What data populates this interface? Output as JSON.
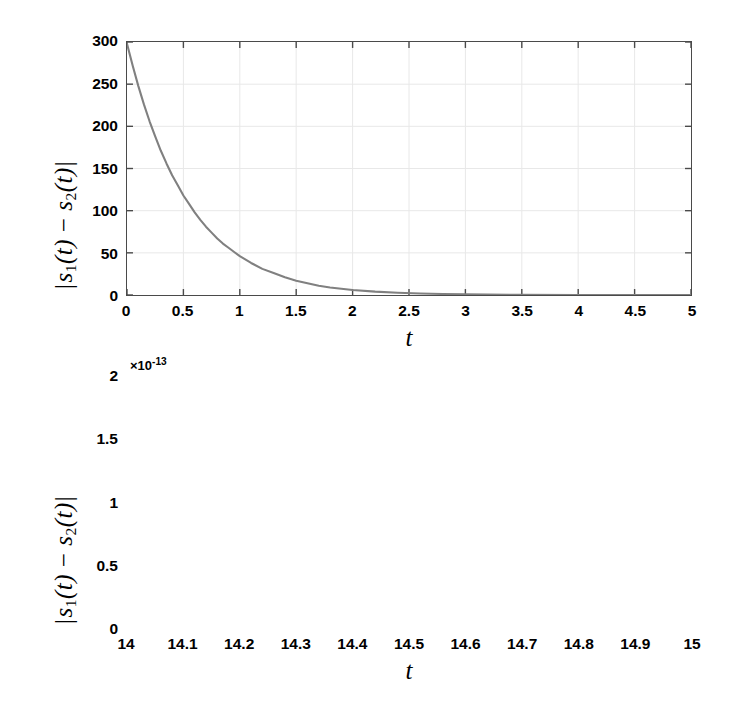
{
  "figure": {
    "background": "#ffffff",
    "curve_color": "#808080",
    "axis_color": "#4a4a4a",
    "grid_color": "#e8e8e8"
  },
  "chart_data": [
    {
      "type": "line",
      "panel": "top",
      "title": "",
      "xlabel": "t",
      "ylabel": "|s_1(t) - s_2(t)|",
      "ylabel_parts": {
        "open_bar": "|",
        "s": "s",
        "sub1": "1",
        "arg1": "(t)",
        "minus": "−",
        "sub2": "2",
        "arg2": "(t)",
        "close_bar": "|"
      },
      "xlim": [
        0,
        5
      ],
      "ylim": [
        0,
        300
      ],
      "grid": true,
      "legend": null,
      "xticks": [
        0,
        0.5,
        1,
        1.5,
        2,
        2.5,
        3,
        3.5,
        4,
        4.5,
        5
      ],
      "xticklabels": [
        "0",
        "0.5",
        "1",
        "1.5",
        "2",
        "2.5",
        "3",
        "3.5",
        "4",
        "4.5",
        "5"
      ],
      "yticks": [
        0,
        50,
        100,
        150,
        200,
        250,
        300
      ],
      "yticklabels": [
        "0",
        "50",
        "100",
        "150",
        "200",
        "250",
        "300"
      ],
      "y_exponent_label": "",
      "series": [
        {
          "name": "|s1(t)-s2(t)|",
          "x": [
            0,
            0.05,
            0.1,
            0.15,
            0.2,
            0.25,
            0.3,
            0.35,
            0.4,
            0.45,
            0.5,
            0.55,
            0.6,
            0.65,
            0.7,
            0.75,
            0.8,
            0.85,
            0.9,
            0.95,
            1.0,
            1.1,
            1.2,
            1.3,
            1.4,
            1.5,
            1.6,
            1.7,
            1.8,
            1.9,
            2.0,
            2.2,
            2.4,
            2.6,
            2.8,
            3.0,
            3.5,
            4.0,
            4.5,
            5.0
          ],
          "y": [
            298,
            272,
            248,
            226,
            206,
            188,
            171,
            156,
            142,
            130,
            118,
            108,
            98,
            89,
            81,
            74,
            67,
            61,
            56,
            51,
            46,
            38,
            31,
            26,
            21,
            17,
            14,
            11,
            9,
            7.4,
            6,
            4,
            2.7,
            1.8,
            1.2,
            0.8,
            0.26,
            0.09,
            0.03,
            0.01
          ]
        }
      ]
    },
    {
      "type": "line",
      "panel": "bottom",
      "title": "",
      "xlabel": "t",
      "ylabel": "|s_1(t) - s_2(t)|",
      "ylabel_parts": {
        "open_bar": "|",
        "s": "s",
        "sub1": "1",
        "arg1": "(t)",
        "minus": "−",
        "sub2": "2",
        "arg2": "(t)",
        "close_bar": "|"
      },
      "xlim": [
        14,
        15
      ],
      "ylim": [
        0,
        2
      ],
      "grid": true,
      "legend": null,
      "xticks": [
        14,
        14.1,
        14.2,
        14.3,
        14.4,
        14.5,
        14.6,
        14.7,
        14.8,
        14.9,
        15
      ],
      "xticklabels": [
        "14",
        "14.1",
        "14.2",
        "14.3",
        "14.4",
        "14.5",
        "14.6",
        "14.7",
        "14.8",
        "14.9",
        "15"
      ],
      "yticks": [
        0,
        0.5,
        1,
        1.5,
        2
      ],
      "yticklabels": [
        "0",
        "0.5",
        "1",
        "1.5",
        "2"
      ],
      "y_exponent_label": "×10",
      "y_exponent_power": "-13",
      "series": [
        {
          "name": "|s1(t)-s2(t)|",
          "x": [
            14.0,
            14.02,
            14.04,
            14.06,
            14.08,
            14.1,
            14.12,
            14.14,
            14.16,
            14.18,
            14.2,
            14.22,
            14.24,
            14.26,
            14.28,
            14.3,
            14.32,
            14.34,
            14.36,
            14.38,
            14.4,
            14.42,
            14.44,
            14.46,
            14.48,
            14.5,
            14.52,
            14.54,
            14.56,
            14.58,
            14.6,
            14.62,
            14.64,
            14.66,
            14.68,
            14.7,
            14.72,
            14.74,
            14.76,
            14.78,
            14.8,
            14.82,
            14.84,
            14.86,
            14.88,
            14.9,
            14.92,
            14.94,
            14.96,
            14.98,
            15.0
          ],
          "y": [
            1.9,
            1.84,
            1.78,
            1.72,
            1.66,
            1.6,
            1.55,
            1.5,
            1.45,
            1.4,
            1.35,
            1.3,
            1.26,
            1.21,
            1.17,
            1.13,
            1.08,
            1.04,
            1.0,
            0.96,
            0.92,
            0.86,
            0.82,
            0.79,
            0.76,
            0.72,
            0.68,
            0.65,
            0.62,
            0.59,
            0.56,
            0.53,
            0.5,
            0.47,
            0.45,
            0.42,
            0.4,
            0.38,
            0.36,
            0.34,
            0.32,
            0.31,
            0.3,
            0.28,
            0.26,
            0.25,
            0.23,
            0.22,
            0.2,
            0.18,
            0.16
          ]
        }
      ]
    }
  ]
}
